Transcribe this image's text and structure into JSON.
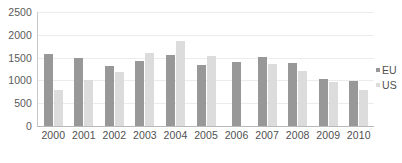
{
  "chart_data": {
    "type": "bar",
    "title": "",
    "subtitle": "",
    "xlabel": "",
    "ylabel": "",
    "categories": [
      "2000",
      "2001",
      "2002",
      "2003",
      "2004",
      "2005",
      "2006",
      "2007",
      "2008",
      "2009",
      "2010"
    ],
    "series": [
      {
        "name": "EU",
        "color": "#989898",
        "values": [
          1590,
          1500,
          1310,
          1430,
          1550,
          1345,
          1395,
          1520,
          1380,
          1040,
          990
        ]
      },
      {
        "name": "US",
        "color": "#dcdcdc",
        "values": [
          800,
          1010,
          1190,
          1610,
          1860,
          1525,
          0,
          1370,
          1215,
          960,
          785
        ]
      }
    ],
    "ylim": [
      0,
      2500
    ],
    "ytick_values": [
      0,
      500,
      1000,
      1500,
      2000,
      2500
    ],
    "ytick_labels": [
      "0",
      "500",
      "1000",
      "1500",
      "2000",
      "2500"
    ],
    "grid": true,
    "grid_axis": "y",
    "legend_position": "right",
    "legend": [
      {
        "label": "EU",
        "color": "#989898"
      },
      {
        "label": "US",
        "color": "#dcdcdc"
      }
    ]
  },
  "colors": {
    "background": "#ffffff",
    "gridline": "#ececec",
    "axis": "#b8b8b8",
    "tick_text": "#4f4f4f",
    "series_eu": "#989898",
    "series_us": "#dcdcdc"
  }
}
